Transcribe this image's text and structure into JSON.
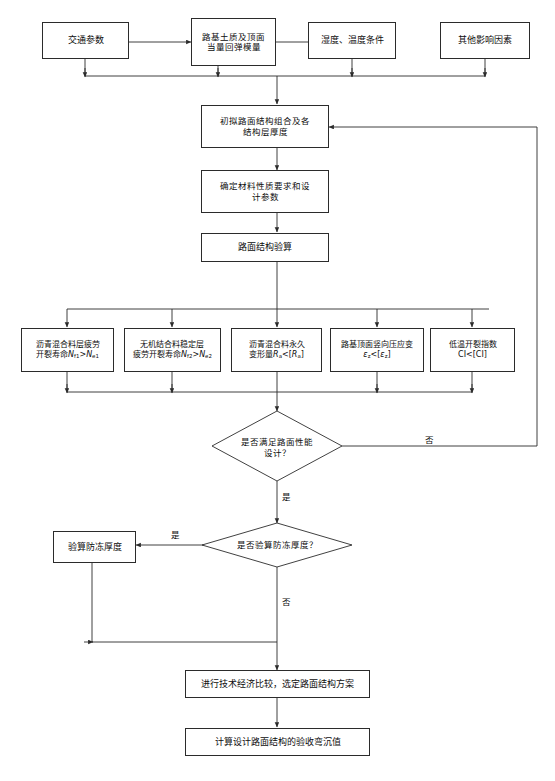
{
  "diagram": {
    "type": "flowchart",
    "title_visible": false,
    "language": "zh-CN",
    "colors": {
      "stroke": "#2b2b2b",
      "text": "#0d0d0d",
      "background": "#ffffff"
    }
  },
  "nodes": {
    "traffic_params": "交通参数",
    "subgrade_modulus": "路基土质及顶面\n当量回弹模量",
    "humidity_temp": "湿度、温度条件",
    "other_factors": "其他影响因素",
    "initial_structure": "初拟路面结构组合及各\n结构层厚度",
    "material_params": "确定材料性质要求和设\n计参数",
    "structure_check": "路面结构验算",
    "criteria_1_line1": "沥青混合料层疲劳",
    "criteria_1_line2_pre": "开裂寿命",
    "criteria_1_line2_formula": "Nf1>Ne1",
    "criteria_2_line1": "无机结合料稳定层",
    "criteria_2_line2_pre": "疲劳开裂寿命",
    "criteria_2_line2_formula": "Nf2>Ne2",
    "criteria_3_line1": "沥青混合料永久",
    "criteria_3_line2_pre": "变形量",
    "criteria_3_line2_formula": "Ra<[Ra]",
    "criteria_4_line1": "路基顶面竖向压应变",
    "criteria_4_line2_formula": "εz<[εz]",
    "criteria_5_line1": "低温开裂指数",
    "criteria_5_line2_formula": "CI<[CI]",
    "decision_1": "是否满足路面性能\n设计？",
    "decision_2": "是否验算防冻厚度？",
    "frost_thickness": "验算防冻厚度",
    "economic_compare": "进行技术经济比较，选定路面结构方案",
    "deflection_value": "计算设计路面结构的验收弯沉值"
  },
  "edge_labels": {
    "decision1_no": "否",
    "decision1_yes": "是",
    "decision2_yes": "是",
    "decision2_no": "否"
  }
}
